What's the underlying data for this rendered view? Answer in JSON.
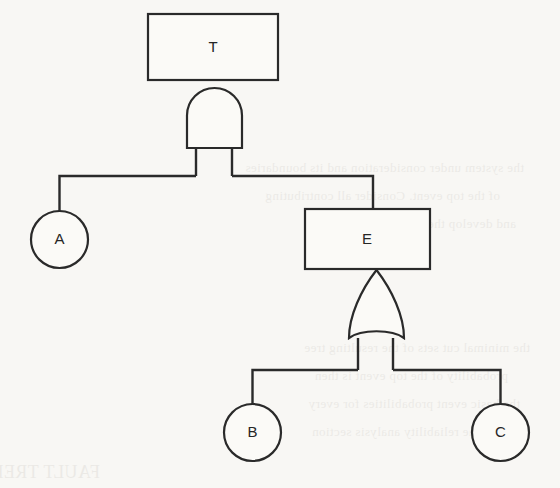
{
  "diagram": {
    "kind": "fault-tree",
    "background_color": "#f8f7f4",
    "stroke_color": "#2a2a2a",
    "fill_color": "#fbfaf7",
    "width": 560,
    "height": 488
  },
  "nodes": {
    "top_event": {
      "id": "T",
      "label": "T",
      "shape": "rectangle",
      "x": 148,
      "y": 14,
      "width": 130,
      "height": 66,
      "cx": 213,
      "cy": 47
    },
    "intermediate_event": {
      "id": "E",
      "label": "E",
      "shape": "rectangle",
      "x": 305,
      "y": 209,
      "width": 125,
      "height": 60,
      "cx": 367,
      "cy": 239
    },
    "basic_event_a": {
      "id": "A",
      "label": "A",
      "shape": "circle",
      "cx": 59.5,
      "cy": 239.5,
      "r": 28.5
    },
    "basic_event_b": {
      "id": "B",
      "label": "B",
      "shape": "circle",
      "cx": 252.5,
      "cy": 432.5,
      "r": 28.5
    },
    "basic_event_c": {
      "id": "C",
      "label": "C",
      "shape": "circle",
      "cx": 500.5,
      "cy": 432.5,
      "r": 28.5
    }
  },
  "gates": {
    "and_gate": {
      "type": "AND",
      "x": 187,
      "y": 88,
      "width": 55,
      "height": 60,
      "cx": 214.5,
      "output_y": 80,
      "bottom_y": 148,
      "leg_left_x": 196,
      "leg_right_x": 232
    },
    "or_gate": {
      "type": "OR",
      "x": 349,
      "y": 270,
      "width": 55,
      "height": 73,
      "cx": 376.5,
      "output_y": 269,
      "bottom_y": 343,
      "leg_left_x": 358,
      "leg_right_x": 393
    }
  },
  "buses": {
    "upper": {
      "y": 176,
      "x_start": 59.5,
      "x_end": 373
    },
    "lower": {
      "y": 370,
      "x_start": 252.5,
      "x_end": 500.5
    }
  },
  "ghost_text": {
    "lines": [
      {
        "text": "the system under consideration and its boundaries",
        "x": 36,
        "y": 168
      },
      {
        "text": "of the top event. Consider all contributing",
        "x": 60,
        "y": 196
      },
      {
        "text": "and develop the fault tree structure",
        "x": 44,
        "y": 224
      },
      {
        "text": "the minimal cut sets of the resulting tree",
        "x": 30,
        "y": 348
      },
      {
        "text": "probability of the top event is then",
        "x": 52,
        "y": 376
      },
      {
        "text": "the basic event probabilities for every",
        "x": 40,
        "y": 404
      },
      {
        "text": "in the reliability analysis section",
        "x": 66,
        "y": 432
      },
      {
        "text": "FAULT TREE",
        "x": 470,
        "y": 470
      }
    ]
  }
}
